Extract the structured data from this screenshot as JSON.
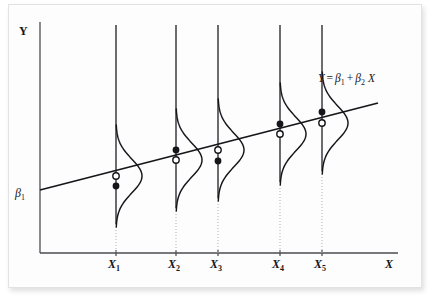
{
  "figure": {
    "kind": "population-regression-function-diagram",
    "background_color": "#fdfdfd",
    "ink_color": "#16161a"
  },
  "axes": {
    "y_axis_label": "Y",
    "x_axis_label": "X",
    "intercept_label": "β",
    "intercept_sub": "1",
    "origin": {
      "x": 40,
      "y": 253
    },
    "x_axis_end": 398,
    "y_axis_top": 22
  },
  "equation": {
    "text_y": "Y",
    "equals": "=",
    "beta": "β",
    "sub1": "1",
    "plus": "+",
    "sub2": "2",
    "x": "X",
    "full": "Y = β1 + β2 X",
    "position": {
      "x": 318,
      "y": 79
    }
  },
  "chart_data": {
    "type": "line",
    "title": "",
    "subtitle": "",
    "xlabel": "X",
    "ylabel": "Y",
    "grid": false,
    "legend": false,
    "annotations": [
      {
        "text": "Y = β1 + β2 X",
        "x": 318,
        "y": 79
      },
      {
        "text": "β1",
        "x": 18,
        "y": 190
      }
    ],
    "regression_line": {
      "name": "Population regression line",
      "equation": "Y = β1 + β2 X",
      "start": {
        "x": 40,
        "y": 190
      },
      "end": {
        "x": 378,
        "y": 103
      }
    },
    "categories": [
      "X1",
      "X2",
      "X3",
      "X4",
      "X5"
    ],
    "tick_labels": [
      "X",
      "X",
      "X",
      "X",
      "X"
    ],
    "tick_subscripts": [
      "1",
      "2",
      "3",
      "4",
      "5"
    ],
    "x_pixels": [
      116,
      176,
      218,
      280,
      322
    ],
    "tick_label_y": 266,
    "vertical_line_top": 25,
    "vertical_line_bottom": 253,
    "series": [
      {
        "name": "Conditional mean E(Y|X) — open circle on line",
        "marker": "open-circle",
        "values": [
          176,
          160,
          150,
          134,
          123
        ]
      },
      {
        "name": "Observed Y — filled dot",
        "marker": "filled-circle",
        "values": [
          186,
          150,
          161,
          124,
          112
        ]
      }
    ],
    "distributions": [
      {
        "category": "X1",
        "center_y": 176,
        "amplitude": 26,
        "spread": 17
      },
      {
        "category": "X2",
        "center_y": 160,
        "amplitude": 26,
        "spread": 17
      },
      {
        "category": "X3",
        "center_y": 150,
        "amplitude": 26,
        "spread": 17
      },
      {
        "category": "X4",
        "center_y": 134,
        "amplitude": 26,
        "spread": 17
      },
      {
        "category": "X5",
        "center_y": 123,
        "amplitude": 26,
        "spread": 17
      }
    ]
  }
}
